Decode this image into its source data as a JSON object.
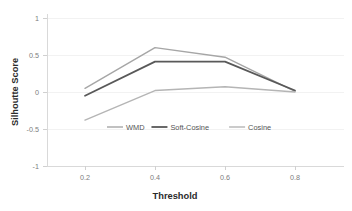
{
  "chart_data": {
    "type": "line",
    "title": "",
    "xlabel": "Threshold",
    "ylabel": "Silhoutte Score",
    "x": [
      0.2,
      0.4,
      0.6,
      0.8
    ],
    "xtick_labels": [
      "0.2",
      "0.4",
      "0.6",
      "0.8"
    ],
    "ytick_labels": [
      "1",
      "0.5",
      "0",
      "-0.5",
      "-1"
    ],
    "ytick_values": [
      1,
      0.5,
      0,
      -0.5,
      -1
    ],
    "ylim": [
      -1,
      1
    ],
    "xlim": [
      0.1,
      0.9
    ],
    "grid": true,
    "legend_position": "inside-center",
    "series": [
      {
        "name": "WMD",
        "color": "#a6a6a6",
        "width": 1.4,
        "values": [
          0.05,
          0.6,
          0.47,
          0.01
        ]
      },
      {
        "name": "Soft-Cosine",
        "color": "#595959",
        "width": 1.8,
        "values": [
          -0.05,
          0.41,
          0.41,
          0.02
        ]
      },
      {
        "name": "Cosine",
        "color": "#b5b5b5",
        "width": 1.4,
        "values": [
          -0.38,
          0.02,
          0.07,
          0.0
        ]
      }
    ]
  },
  "legend": {
    "items": [
      {
        "label": "WMD",
        "color": "#a6a6a6"
      },
      {
        "label": "Soft-Cosine",
        "color": "#595959"
      },
      {
        "label": "Cosine",
        "color": "#b5b5b5"
      }
    ]
  }
}
